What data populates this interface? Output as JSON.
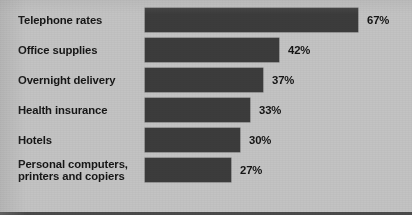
{
  "chart_data": {
    "type": "bar",
    "orientation": "horizontal",
    "title": "",
    "subtitle": "",
    "xlabel": "",
    "ylabel": "",
    "xlim": [
      0,
      67
    ],
    "grid": false,
    "legend": null,
    "value_suffix": "%",
    "categories": [
      "Telephone rates",
      "Office supplies",
      "Overnight delivery",
      "Health insurance",
      "Hotels",
      "Personal computers,\nprinters and copiers"
    ],
    "values": [
      67,
      42,
      37,
      33,
      30,
      27
    ],
    "value_labels": [
      "67%",
      "42%",
      "37%",
      "33%",
      "30%",
      "27%"
    ],
    "colors": {
      "bar": "#3c3c3c",
      "background": "#c3c3c3",
      "text": "#161616",
      "rule": "#4a4a4a"
    }
  }
}
